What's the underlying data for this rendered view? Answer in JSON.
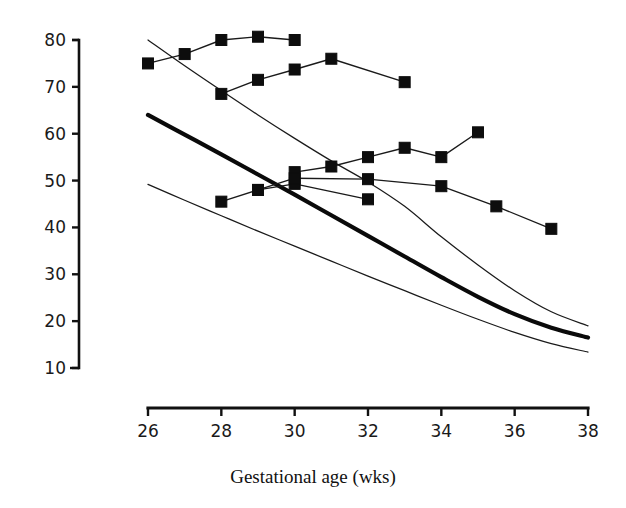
{
  "chart_data": {
    "type": "line",
    "title": "",
    "xlabel": "Gestational age (wks)",
    "ylabel": "",
    "xlim": [
      26,
      38
    ],
    "ylim": [
      10,
      83
    ],
    "grid": false,
    "legend": "none",
    "x_ticks": [
      26,
      28,
      30,
      32,
      34,
      36,
      38
    ],
    "y_ticks": [
      10,
      20,
      30,
      40,
      50,
      60,
      70,
      80
    ],
    "x_tick_labels": [
      "26",
      "28",
      "30",
      "32",
      "34",
      "36",
      "38"
    ],
    "y_tick_labels": [
      "10",
      "20",
      "30",
      "40",
      "50",
      "60",
      "70",
      "80"
    ],
    "reference_curves": [
      {
        "name": "upper centile",
        "style": "thin",
        "x": [
          26,
          27,
          28,
          29,
          30,
          31,
          32,
          33,
          34,
          35,
          36,
          37,
          38
        ],
        "y": [
          80.0,
          74.5,
          69.2,
          64.0,
          59.0,
          54.2,
          49.7,
          44.5,
          38.0,
          32.0,
          26.5,
          22.0,
          19.0
        ]
      },
      {
        "name": "median centile",
        "style": "thick",
        "x": [
          26,
          27,
          28,
          29,
          30,
          31,
          32,
          33,
          34,
          35,
          36,
          37,
          38
        ],
        "y": [
          64.0,
          59.8,
          55.6,
          51.3,
          47.0,
          42.6,
          38.2,
          33.8,
          29.4,
          25.2,
          21.5,
          18.6,
          16.5
        ]
      },
      {
        "name": "lower centile",
        "style": "thin",
        "x": [
          26,
          27,
          28,
          29,
          30,
          31,
          32,
          33,
          34,
          35,
          36,
          37,
          38
        ],
        "y": [
          49.2,
          45.8,
          42.5,
          39.2,
          36.0,
          32.8,
          29.6,
          26.5,
          23.4,
          20.4,
          17.6,
          15.2,
          13.4
        ]
      }
    ],
    "series": [
      {
        "name": "subject-1",
        "marker": "filled-square",
        "x": [
          26,
          27,
          28,
          29,
          30
        ],
        "y": [
          75.0,
          77.0,
          80.0,
          80.7,
          80.0
        ]
      },
      {
        "name": "subject-2",
        "marker": "filled-square",
        "x": [
          28,
          29,
          30,
          31,
          33
        ],
        "y": [
          68.5,
          71.5,
          73.7,
          76.0,
          71.0
        ]
      },
      {
        "name": "subject-3",
        "marker": "filled-square",
        "x": [
          30,
          31,
          32,
          33,
          34,
          35
        ],
        "y": [
          51.8,
          53.0,
          55.0,
          57.0,
          55.0,
          60.3
        ]
      },
      {
        "name": "subject-4",
        "marker": "filled-square",
        "x": [
          28,
          29,
          30,
          32
        ],
        "y": [
          45.5,
          48.0,
          49.3,
          46.0
        ]
      },
      {
        "name": "subject-5",
        "marker": "filled-square",
        "x": [
          29,
          30,
          32,
          34,
          35.5,
          37
        ],
        "y": [
          48.0,
          50.5,
          50.3,
          48.8,
          44.5,
          39.7
        ]
      }
    ]
  },
  "colors": {
    "ink": "#111111",
    "background": "#ffffff",
    "marker": "#0d0d0d"
  }
}
